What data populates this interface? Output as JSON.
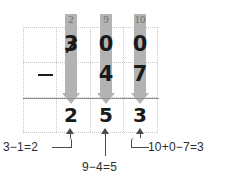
{
  "problem": {
    "title": "Subtraction with borrowing: 300 minus 47",
    "minuend": "300",
    "subtrahend": "47",
    "difference": "253",
    "operator": "−"
  },
  "columns": {
    "headers": [
      {
        "name": "hundreds",
        "borrow_value": "2"
      },
      {
        "name": "tens",
        "borrow_value": "9"
      },
      {
        "name": "ones",
        "borrow_value": "10"
      }
    ]
  },
  "rows": {
    "minuend_digits": [
      {
        "value": "3",
        "struck_out": "yes"
      },
      {
        "value": "0",
        "struck_out": "no"
      },
      {
        "value": "0",
        "struck_out": "no"
      }
    ],
    "subtrahend_digits": [
      {
        "value": ""
      },
      {
        "value": "4"
      },
      {
        "value": "7"
      }
    ],
    "answer_digits": [
      {
        "value": "2"
      },
      {
        "value": "5"
      },
      {
        "value": "3"
      }
    ]
  },
  "callouts": {
    "hundreds": "3−1=2",
    "tens": "9−4=5",
    "ones": "10+0−7=3"
  },
  "colors": {
    "arrow_gray": "#b3b3b3",
    "grid_dotted": "#c9c9c9",
    "rule_line": "#8f8f8f",
    "ink": "#1a1a1a",
    "header_digit": "#6e6e6e",
    "callout_ink": "#2b2b2b"
  }
}
